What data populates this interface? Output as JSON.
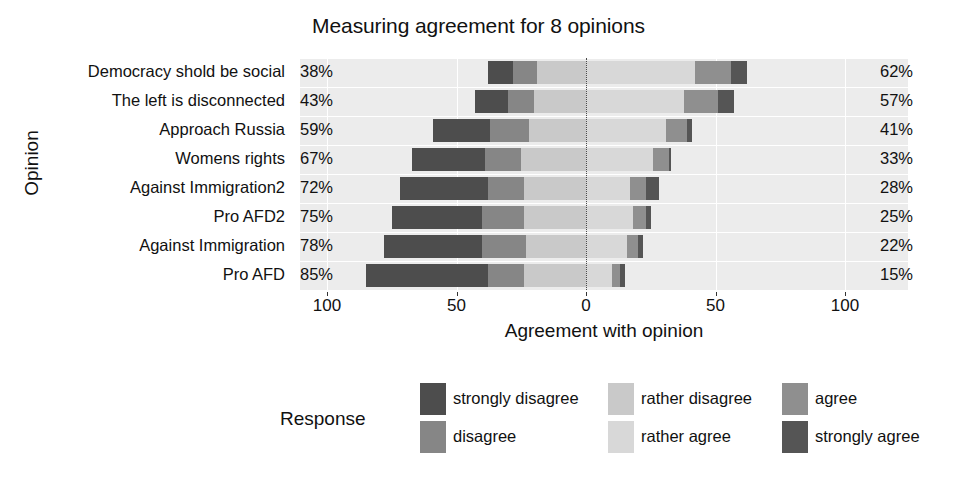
{
  "chart_data": {
    "type": "bar",
    "subtype": "diverging-stacked-likert",
    "title": "Measuring agreement for 8 opinions",
    "xlabel": "Agreement with opinion",
    "ylabel": "Opinion",
    "xlim": [
      -100,
      100
    ],
    "xticks": [
      -100,
      -50,
      0,
      50,
      100
    ],
    "xticklabels": [
      "100",
      "50",
      "0",
      "50",
      "100"
    ],
    "grid": true,
    "legend_title": "Response",
    "legend_position": "bottom",
    "legend_entries": [
      {
        "label": "strongly disagree",
        "color": "#4d4d4d"
      },
      {
        "label": "disagree",
        "color": "#868686"
      },
      {
        "label": "rather disagree",
        "color": "#c9c9c9"
      },
      {
        "label": "rather agree",
        "color": "#d8d8d8"
      },
      {
        "label": "agree",
        "color": "#8f8f8f"
      },
      {
        "label": "strongly agree",
        "color": "#555555"
      }
    ],
    "categories": [
      "Democracy shold be social",
      "The left is disconnected",
      "Approach Russia",
      "Womens rights",
      "Against Immigration2",
      "Pro AFD2",
      "Against Immigration",
      "Pro AFD"
    ],
    "left_labels": [
      "38%",
      "43%",
      "59%",
      "67%",
      "72%",
      "75%",
      "78%",
      "85%"
    ],
    "right_labels": [
      "62%",
      "57%",
      "41%",
      "33%",
      "28%",
      "25%",
      "22%",
      "15%"
    ],
    "series": [
      {
        "name": "strongly disagree",
        "values": [
          10,
          13,
          22,
          28,
          34,
          35,
          38,
          47
        ]
      },
      {
        "name": "disagree",
        "values": [
          9,
          10,
          15,
          14,
          14,
          16,
          17,
          14
        ]
      },
      {
        "name": "rather disagree",
        "values": [
          19,
          20,
          22,
          25,
          24,
          24,
          23,
          24
        ]
      },
      {
        "name": "rather agree",
        "values": [
          42,
          38,
          31,
          26,
          17,
          18,
          16,
          10
        ]
      },
      {
        "name": "agree",
        "values": [
          14,
          13,
          8,
          6,
          6,
          5,
          4,
          3
        ]
      },
      {
        "name": "strongly agree",
        "values": [
          6,
          6,
          2,
          1,
          5,
          2,
          2,
          2
        ]
      }
    ]
  }
}
